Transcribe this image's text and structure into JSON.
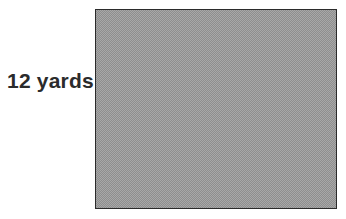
{
  "figure": {
    "type": "shaded-rectangle-with-dimension-label",
    "background_color": "#ffffff",
    "labels": {
      "left_dimension": "12 yards"
    },
    "shape": {
      "name": "rectangle",
      "fill_color": "#a8a8a8",
      "fill_pattern": "checkerboard-dither-50-percent",
      "border_color": "#2b2b2b",
      "border_width_px": 1.5,
      "interior_text": ""
    },
    "text_color": "#2b2b2b"
  }
}
